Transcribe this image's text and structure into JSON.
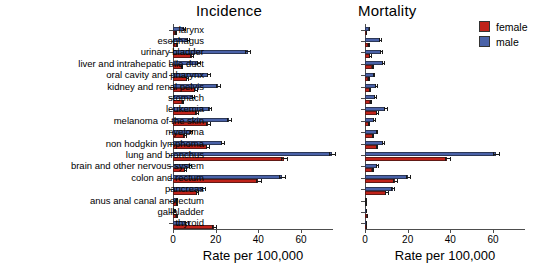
{
  "figure": {
    "background": "#ffffff",
    "colors": {
      "male": "#4a62a8",
      "female": "#c0231a",
      "axis": "#4d4d4d"
    }
  },
  "legend": {
    "position": "top-right",
    "entries": [
      {
        "label": "female",
        "color": "#c0231a"
      },
      {
        "label": "male",
        "color": "#4a62a8"
      }
    ]
  },
  "panels": {
    "incidence": {
      "title": "Incidence",
      "xlabel": "Rate per 100,000"
    },
    "mortality": {
      "title": "Mortality",
      "xlabel": "Rate per 100,000"
    }
  },
  "axis": {
    "ticks": [
      "0",
      "20",
      "40",
      "60"
    ],
    "tick_values": [
      0,
      20,
      40,
      60
    ],
    "xlim": [
      0,
      75
    ]
  },
  "chart_data": {
    "type": "bar",
    "orientation": "horizontal",
    "title": "",
    "xlabel": "Rate per 100,000",
    "ylabel": "",
    "xlim": [
      0,
      75
    ],
    "ticks": [
      0,
      20,
      40,
      60
    ],
    "grid": false,
    "legend_position": "top-right",
    "panels": [
      "Incidence",
      "Mortality"
    ],
    "categories": [
      "larynx",
      "esophagus",
      "urinary bladder",
      "liver and intrahepatic bile duct",
      "oral cavity and pharynx",
      "kidney and renal pelvis",
      "stomach",
      "leukemia",
      "melanoma of the skin",
      "myeloma",
      "non hodgkin lymphoma",
      "lung and bronchus",
      "brain and other nervous system",
      "colon and rectum",
      "pancreas",
      "anus anal canal anorectum",
      "gallbladder",
      "thyroid"
    ],
    "incidence": {
      "series": [
        {
          "name": "male",
          "color": "#4a62a8",
          "values": [
            5.2,
            7.2,
            35.0,
            11.8,
            16.6,
            21.0,
            9.4,
            17.2,
            26.3,
            8.5,
            23.2,
            74.5,
            8.0,
            51.0,
            14.2,
            1.5,
            0.9,
            6.3
          ],
          "errors": [
            0.4,
            0.5,
            1.2,
            0.7,
            0.8,
            0.9,
            0.6,
            0.8,
            1.1,
            0.6,
            0.9,
            1.6,
            0.5,
            1.3,
            0.7,
            0.2,
            0.2,
            0.5
          ]
        },
        {
          "name": "female",
          "color": "#c0231a",
          "values": [
            1.1,
            1.7,
            8.7,
            4.0,
            6.4,
            10.4,
            4.4,
            11.1,
            16.6,
            5.4,
            16.1,
            52.0,
            5.7,
            40.0,
            11.2,
            1.8,
            1.5,
            19.2
          ],
          "errors": [
            0.2,
            0.2,
            0.6,
            0.4,
            0.5,
            0.7,
            0.4,
            0.7,
            0.9,
            0.5,
            0.8,
            1.4,
            0.4,
            1.2,
            0.6,
            0.2,
            0.2,
            0.9
          ]
        }
      ]
    },
    "mortality": {
      "series": [
        {
          "name": "male",
          "color": "#4a62a8",
          "values": [
            1.9,
            7.2,
            7.6,
            8.4,
            4.0,
            5.2,
            4.8,
            9.6,
            4.2,
            5.4,
            8.4,
            61.5,
            5.7,
            20.2,
            13.0,
            0.3,
            0.6,
            0.5
          ],
          "errors": [
            0.2,
            0.5,
            0.5,
            0.5,
            0.3,
            0.4,
            0.4,
            0.6,
            0.4,
            0.4,
            0.6,
            1.5,
            0.4,
            0.9,
            0.7,
            0.1,
            0.1,
            0.1
          ]
        },
        {
          "name": "female",
          "color": "#c0231a",
          "values": [
            0.4,
            1.6,
            2.4,
            3.5,
            1.5,
            2.2,
            2.5,
            5.5,
            1.7,
            3.6,
            5.4,
            38.6,
            3.4,
            14.1,
            10.0,
            0.3,
            0.9,
            0.5
          ],
          "errors": [
            0.1,
            0.2,
            0.3,
            0.3,
            0.2,
            0.2,
            0.2,
            0.4,
            0.2,
            0.3,
            0.4,
            1.2,
            0.3,
            0.8,
            0.6,
            0.1,
            0.1,
            0.1
          ]
        }
      ]
    }
  }
}
